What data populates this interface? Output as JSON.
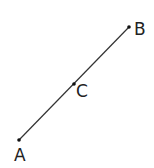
{
  "diagram": {
    "type": "line-segment",
    "points": {
      "A": {
        "label": "A",
        "x": 19,
        "y": 140
      },
      "B": {
        "label": "B",
        "x": 129,
        "y": 27
      },
      "C": {
        "label": "C",
        "x": 74,
        "y": 84
      }
    },
    "segments": [
      {
        "from": "A",
        "to": "B"
      }
    ],
    "colors": {
      "line": "#333333",
      "point": "#111111",
      "label": "#222222"
    }
  }
}
